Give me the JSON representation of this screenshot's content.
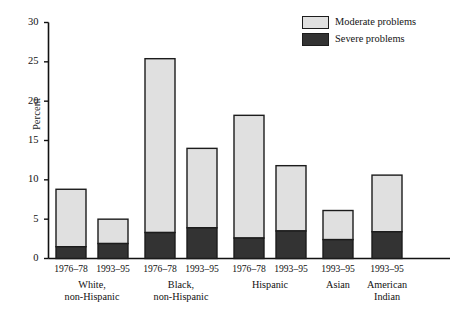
{
  "chart_data": {
    "type": "bar",
    "title": "",
    "subtitle": "",
    "xlabel": "",
    "ylabel": "Percent",
    "ylim": [
      0,
      30
    ],
    "yticks": [
      0,
      5,
      10,
      15,
      20,
      25,
      30
    ],
    "ytick_labels": [
      "0",
      "5",
      "10",
      "15",
      "20",
      "25",
      "30"
    ],
    "grid": false,
    "stacked": true,
    "legend_position": "top-right",
    "legend": [
      "Moderate problems",
      "Severe problems"
    ],
    "colors": {
      "moderate": "#e0e0e0",
      "severe": "#333333",
      "outline": "#1c1c1c",
      "axis": "#111111"
    },
    "categories": [
      "1976–78",
      "1993–95",
      "1976–78",
      "1993–95",
      "1976–78",
      "1993–95",
      "1993–95",
      "1993–95"
    ],
    "groups": [
      {
        "label": "White,\nnon-Hispanic",
        "line1": "White,",
        "line2": "non-Hispanic",
        "bars": [
          0,
          1
        ]
      },
      {
        "label": "Black,\nnon-Hispanic",
        "line1": "Black,",
        "line2": "non-Hispanic",
        "bars": [
          2,
          3
        ]
      },
      {
        "label": "Hispanic",
        "line1": "Hispanic",
        "line2": "",
        "bars": [
          4,
          5
        ]
      },
      {
        "label": "Asian",
        "line1": "Asian",
        "line2": "",
        "bars": [
          6
        ]
      },
      {
        "label": "American\nIndian",
        "line1": "American",
        "line2": "Indian",
        "bars": [
          7
        ]
      }
    ],
    "series": [
      {
        "name": "Severe problems",
        "key": "severe",
        "values": [
          1.5,
          1.9,
          3.3,
          3.9,
          2.6,
          3.5,
          2.4,
          3.4
        ]
      },
      {
        "name": "Moderate problems",
        "key": "moderate",
        "values": [
          7.3,
          3.1,
          22.1,
          10.1,
          15.6,
          8.3,
          3.7,
          7.2
        ]
      }
    ],
    "totals": [
      8.8,
      5.0,
      25.4,
      14.0,
      18.2,
      11.8,
      6.1,
      10.6
    ]
  }
}
